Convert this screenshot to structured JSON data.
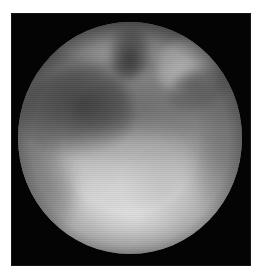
{
  "document": {
    "page_background": "#ffffff",
    "caption": ""
  },
  "frame": {
    "label": "",
    "background_color": "#040404",
    "left": 11,
    "top": 13,
    "width": 240,
    "height": 253
  },
  "image": {
    "modality": "arthroscopy",
    "color_mode": "grayscale",
    "field_of_view": "circular",
    "circle": {
      "center_x": 119,
      "center_y": 125,
      "radius": 112
    },
    "palette": {
      "background": "#040404",
      "rim_shadow": "#2a2a2a",
      "mid_tissue": "#8a8a8a",
      "dark_recess": "#3c3c3c",
      "bright_tissue": "#d2d2d2",
      "highlight": "#f0f0f0"
    },
    "features": [
      {
        "name": "dark-crescent",
        "description": "dark crescent recess along upper-left",
        "tone": "dark"
      },
      {
        "name": "mid-shadow",
        "description": "broad dim band across upper middle",
        "tone": "mid-dark"
      },
      {
        "name": "top-notch",
        "description": "dark cleft at top center",
        "tone": "dark"
      },
      {
        "name": "bright-lobe",
        "description": "bright rounded lobe upper right",
        "tone": "bright"
      },
      {
        "name": "lobe-shadow",
        "description": "shadow rim below the bright lobe",
        "tone": "dark"
      },
      {
        "name": "top-highlight",
        "description": "specular band along the top rim",
        "tone": "bright"
      },
      {
        "name": "bright-pool",
        "description": "broad bright tissue surface filling the lower half",
        "tone": "bright"
      },
      {
        "name": "ridge",
        "description": "faint horizontal ridge dividing upper and lower regions",
        "tone": "mid"
      },
      {
        "name": "left-rim-shadow",
        "description": "vignette shading on the lower-left rim",
        "tone": "mid-dark"
      },
      {
        "name": "right-rim-shadow",
        "description": "vignette shading on the mid-right rim",
        "tone": "mid-dark"
      },
      {
        "name": "bottom-glint",
        "description": "soft bright glint near the bottom center",
        "tone": "bright"
      }
    ],
    "overlay_text": ""
  }
}
